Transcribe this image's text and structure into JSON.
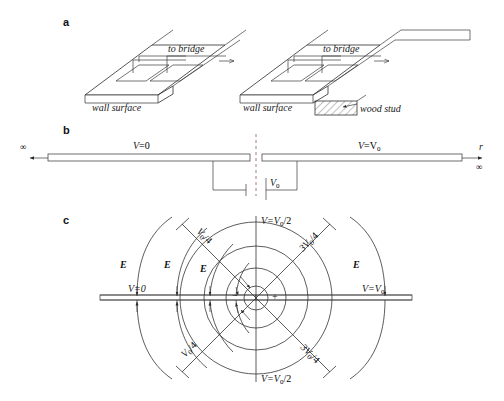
{
  "figure": {
    "panels": [
      {
        "letter": "a",
        "labels": {
          "to_bridge_left": "to  bridge",
          "to_bridge_right": "to  bridge",
          "wall_surface_left": "wall  surface",
          "wall_surface_right": "wall  surface",
          "wood_stud": "wood  stud"
        }
      },
      {
        "letter": "b",
        "labels": {
          "infinity_left": "∞",
          "infinity_right": "∞",
          "r_axis": "r",
          "v_left": "V",
          "v_left_eq": "=0",
          "v_right": "V",
          "v_right_eq": "=V",
          "v_right_sub": "0",
          "source_v": "V",
          "source_sub": "0"
        }
      },
      {
        "letter": "c",
        "labels": {
          "v_zero": "V=0",
          "v_v0": "V=V",
          "v_v0_sub": "0",
          "v_half_top": "V=V",
          "v_half_top_sub": "0",
          "v_half_top_tail": "/2",
          "v_half_bottom": "V=V",
          "v_half_bottom_sub": "0",
          "v_half_bottom_tail": "/2",
          "v_quarter_upper": "V",
          "v_quarter_upper_sub": "0",
          "v_quarter_upper_tail": "/4",
          "v_quarter_lower": "V",
          "v_quarter_lower_sub": "0",
          "v_quarter_lower_tail": "/4",
          "v_3quarter_upper": "3V",
          "v_3quarter_upper_sub": "0",
          "v_3quarter_upper_tail": "/4",
          "v_3quarter_lower": "3V",
          "v_3quarter_lower_sub": "0",
          "v_3quarter_lower_tail": "/4",
          "field_e": "E",
          "charge_negative": "−",
          "charge_positive": "+"
        },
        "field_labels": [
          "E",
          "E",
          "E",
          "E"
        ]
      }
    ]
  },
  "colors": {
    "stroke": "#2b2b2b",
    "dashed_center": "#9a6a6a",
    "plate_fill": "#ffffff",
    "wall_fill": "#e8e8e8"
  }
}
